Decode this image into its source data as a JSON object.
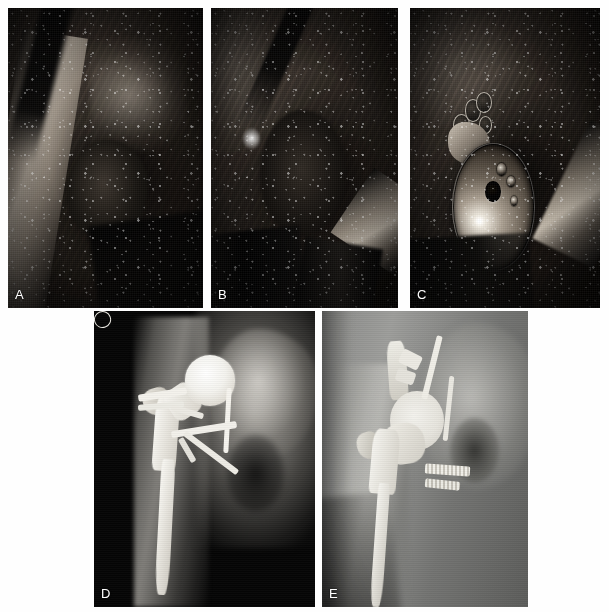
{
  "figure": {
    "canvas": {
      "width": 609,
      "height": 612,
      "background": "#ffffff"
    },
    "layout": {
      "rows": 2,
      "top_row_panels": 3,
      "bottom_row_panels": 2
    }
  },
  "panels": [
    {
      "id": "A",
      "label": "A",
      "kind": "intraoperative-photograph",
      "modality": "clinical photo",
      "description": "Dark surgical field exposing the hip joint with retractor at left and soft-tissue debris",
      "palette": {
        "dark": "#15120f",
        "mid": "#5a5148",
        "highlight": "#b3a99c"
      },
      "label_color": "#ffffff",
      "position": {
        "x": 8,
        "y": 8,
        "w": 195,
        "h": 300
      }
    },
    {
      "id": "B",
      "label": "B",
      "kind": "intraoperative-photograph",
      "modality": "clinical photo",
      "description": "Surgical exposure with instrument entering from upper left and retractor blade at lower right",
      "palette": {
        "dark": "#120f0c",
        "mid": "#463f38",
        "highlight": "#d4cabb"
      },
      "label_color": "#ffffff",
      "position": {
        "x": 211,
        "y": 8,
        "w": 187,
        "h": 300
      }
    },
    {
      "id": "C",
      "label": "C",
      "kind": "intraoperative-photograph",
      "modality": "clinical photo",
      "description": "Metallic acetabular cup implant seated in the acetabulum with central screw hole and peripheral screw holes",
      "palette": {
        "dark": "#0d0b09",
        "metal": "#a79d90",
        "specular": "#ffffff"
      },
      "label_color": "#ffffff",
      "position": {
        "x": 410,
        "y": 8,
        "w": 190,
        "h": 300
      }
    },
    {
      "id": "D",
      "label": "D",
      "kind": "radiograph",
      "modality": "plain film X-ray",
      "description": "High-contrast anteroposterior hip radiograph on black background showing femoral stem, large femoral head, cerclage wires and crossing pins",
      "palette": {
        "background": "#050505",
        "bone": "#b9b5ab",
        "metal": "#f4f2ec"
      },
      "label_color": "#ffffff",
      "position": {
        "x": 94,
        "y": 311,
        "w": 221,
        "h": 296
      }
    },
    {
      "id": "E",
      "label": "E",
      "kind": "radiograph",
      "modality": "plain film X-ray",
      "description": "Lower-contrast anteroposterior hip radiograph showing acetabular reconstruction cage with superior fixation pins, transacetabular threaded screws and femoral stem",
      "palette": {
        "background": "#6f706e",
        "bone": "#d4d3ce",
        "metal": "#f2f0e9"
      },
      "label_color": "#ffffff",
      "position": {
        "x": 322,
        "y": 311,
        "w": 206,
        "h": 296
      }
    }
  ]
}
